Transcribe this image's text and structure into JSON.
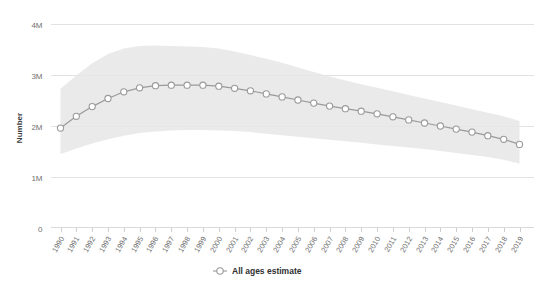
{
  "chart_data": {
    "type": "line",
    "title": "",
    "subtitle": "",
    "xlabel": "",
    "ylabel": "Number",
    "grid": "horizontal",
    "legend_position": "bottom-center",
    "xlim": [
      1990,
      2019
    ],
    "ylim": [
      0,
      4000000
    ],
    "yticks": [
      0,
      1000000,
      2000000,
      3000000,
      4000000
    ],
    "ytick_labels": [
      "0",
      "1M",
      "2M",
      "3M",
      "4M"
    ],
    "categories": [
      "1990",
      "1991",
      "1992",
      "1993",
      "1994",
      "1995",
      "1996",
      "1997",
      "1998",
      "1999",
      "2000",
      "2001",
      "2002",
      "2003",
      "2004",
      "2005",
      "2006",
      "2007",
      "2008",
      "2009",
      "2010",
      "2011",
      "2012",
      "2013",
      "2014",
      "2015",
      "2016",
      "2017",
      "2018",
      "2019"
    ],
    "series": [
      {
        "name": "All ages estimate",
        "marker": "circle-open",
        "color": "#9a9a9a",
        "values": [
          1950000,
          2180000,
          2370000,
          2530000,
          2660000,
          2740000,
          2780000,
          2790000,
          2790000,
          2790000,
          2770000,
          2730000,
          2680000,
          2620000,
          2560000,
          2500000,
          2440000,
          2380000,
          2330000,
          2280000,
          2230000,
          2170000,
          2110000,
          2050000,
          1990000,
          1930000,
          1870000,
          1800000,
          1730000,
          1630000
        ]
      }
    ],
    "uncertainty_band": {
      "name": "All ages estimate uncertainty interval",
      "color": "#e6e6e6",
      "upper": [
        2720000,
        2980000,
        3220000,
        3400000,
        3510000,
        3560000,
        3570000,
        3560000,
        3550000,
        3540000,
        3510000,
        3450000,
        3380000,
        3310000,
        3230000,
        3140000,
        3050000,
        2960000,
        2880000,
        2810000,
        2740000,
        2670000,
        2600000,
        2530000,
        2460000,
        2390000,
        2320000,
        2250000,
        2180000,
        2090000
      ],
      "lower": [
        1440000,
        1550000,
        1650000,
        1730000,
        1800000,
        1850000,
        1880000,
        1900000,
        1910000,
        1910000,
        1900000,
        1890000,
        1870000,
        1840000,
        1810000,
        1780000,
        1750000,
        1720000,
        1690000,
        1660000,
        1630000,
        1600000,
        1570000,
        1540000,
        1500000,
        1460000,
        1420000,
        1380000,
        1330000,
        1250000
      ]
    },
    "legend": [
      {
        "label": "All ages estimate",
        "marker": "circle-open",
        "color": "#9a9a9a"
      }
    ]
  }
}
